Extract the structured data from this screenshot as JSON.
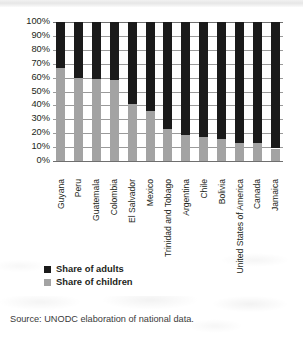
{
  "chart_data": {
    "type": "bar",
    "subtype": "stacked-100-percent-vertical",
    "title": "",
    "subtitle": "",
    "xlabel": "",
    "ylabel": "",
    "ylim": [
      0,
      100
    ],
    "grid": true,
    "legend_position": "bottom-left",
    "categories": [
      "Guyana",
      "Peru",
      "Guatemala",
      "Colombia",
      "El Salvador",
      "Mexico",
      "Trinidad and Tobago",
      "Argentina",
      "Chile",
      "Bolivia",
      "United States of America",
      "Canada",
      "Jamaica"
    ],
    "series": [
      {
        "name": "Share of children",
        "color": "#a3a3a3",
        "values": [
          67,
          60,
          59,
          58,
          41,
          36,
          23,
          19,
          17.5,
          16,
          13,
          13,
          9
        ]
      },
      {
        "name": "Share of adults",
        "color": "#1a1a1a",
        "values": [
          33,
          40,
          41,
          42,
          59,
          64,
          77,
          81,
          82.5,
          84,
          87,
          87,
          91
        ]
      }
    ],
    "y_ticks": [
      "0%",
      "10%",
      "20%",
      "30%",
      "40%",
      "50%",
      "60%",
      "70%",
      "80%",
      "90%",
      "100%"
    ],
    "y_tick_values": [
      0,
      10,
      20,
      30,
      40,
      50,
      60,
      70,
      80,
      90,
      100
    ]
  },
  "legend": {
    "items": [
      {
        "label": "Share of adults",
        "color": "#1a1a1a"
      },
      {
        "label": "Share of children",
        "color": "#a3a3a3"
      }
    ]
  },
  "source": {
    "text": "Source: UNODC elaboration of national data."
  }
}
